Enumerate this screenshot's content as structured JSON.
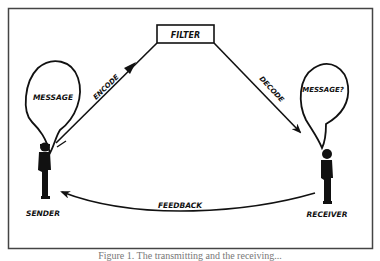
{
  "diagram": {
    "nodes": {
      "filter": "FILTER",
      "sender": "SENDER",
      "receiver": "RECEIVER",
      "sender_bubble": "MESSAGE",
      "receiver_bubble": "MESSAGE?"
    },
    "edges": {
      "encode": "ENCODE",
      "decode": "DECODE",
      "feedback": "FEEDBACK"
    },
    "colors": {
      "ink": "#111111",
      "frame": "#444444"
    }
  },
  "caption": "Figure 1. The transmitting and the receiving..."
}
